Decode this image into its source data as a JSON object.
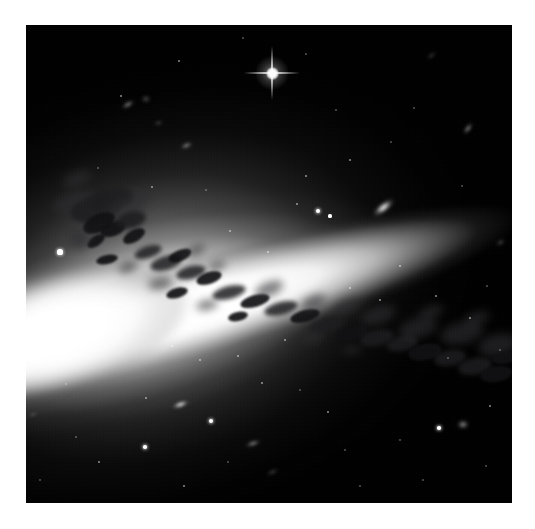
{
  "canvas": {
    "width": 535,
    "height": 529,
    "background_color": "#ffffff"
  },
  "image_panel": {
    "label": "edge-on-spiral-galaxy-astronomical-image",
    "x": 26,
    "y": 25,
    "width": 486,
    "height": 478,
    "background_color": "#000000",
    "border_color": "#000000"
  },
  "scene": {
    "subject": "edge-on spiral galaxy",
    "orientation_label": "disk inclined, descending left to right",
    "disk": {
      "rotation_deg": -16,
      "center_x_pct": 50,
      "center_y_pct": 50,
      "wrap_x": -130,
      "wrap_y": -48,
      "wrap_width": 746,
      "wrap_height": 574,
      "core_color": "#ffffff",
      "halo_color": "#9a9a9a"
    },
    "dust_lane": {
      "color": "#1c1c1e",
      "description": "dark dust lane clumps along the disk plane"
    }
  },
  "bright_star": {
    "label": "foreground star with diffraction spikes",
    "x": 272,
    "y": 73,
    "size": 56,
    "color": "#ffffff",
    "spikes": 4
  },
  "mini_galaxies": [
    {
      "name": "companion-galaxy-edge-on",
      "x": 383,
      "y": 207,
      "w": 27,
      "h": 11,
      "rot": -38,
      "style": ""
    },
    {
      "name": "background-galaxy-upper-left",
      "x": 128,
      "y": 104,
      "w": 16,
      "h": 7,
      "rot": -30,
      "style": "dim"
    },
    {
      "name": "background-galaxy-upper-left-2",
      "x": 146,
      "y": 99,
      "w": 12,
      "h": 10,
      "rot": 0,
      "style": "vdim"
    },
    {
      "name": "background-galaxy-upper-mid",
      "x": 186,
      "y": 145,
      "w": 15,
      "h": 7,
      "rot": -22,
      "style": "dim"
    },
    {
      "name": "background-galaxy-right-upper",
      "x": 468,
      "y": 128,
      "w": 16,
      "h": 7,
      "rot": -52,
      "style": "dim"
    },
    {
      "name": "background-galaxy-lower-left",
      "x": 180,
      "y": 404,
      "w": 19,
      "h": 7,
      "rot": -20,
      "style": ""
    },
    {
      "name": "background-galaxy-lower-mid",
      "x": 253,
      "y": 443,
      "w": 18,
      "h": 7,
      "rot": -18,
      "style": "dim"
    },
    {
      "name": "background-galaxy-right-edge",
      "x": 500,
      "y": 242,
      "w": 13,
      "h": 7,
      "rot": -34,
      "style": "vdim"
    },
    {
      "name": "background-galaxy-top-right",
      "x": 431,
      "y": 55,
      "w": 13,
      "h": 5,
      "rot": -40,
      "style": "vdim"
    },
    {
      "name": "background-galaxy-lower-right",
      "x": 463,
      "y": 424,
      "w": 14,
      "h": 11,
      "rot": 0,
      "style": "dim"
    },
    {
      "name": "background-galaxy-far-left",
      "x": 33,
      "y": 414,
      "w": 14,
      "h": 5,
      "rot": -16,
      "style": "vdim"
    },
    {
      "name": "background-galaxy-bottom",
      "x": 272,
      "y": 472,
      "w": 15,
      "h": 6,
      "rot": -24,
      "style": "vdim"
    },
    {
      "name": "background-galaxy-mid-left",
      "x": 158,
      "y": 123,
      "w": 11,
      "h": 6,
      "rot": -12,
      "style": "vdim"
    }
  ],
  "stars": [
    {
      "x": 60,
      "y": 252,
      "r": 2.6,
      "c": "bright"
    },
    {
      "x": 318,
      "y": 211,
      "r": 2.4,
      "c": "bright"
    },
    {
      "x": 330,
      "y": 216,
      "r": 1.6,
      "c": ""
    },
    {
      "x": 179,
      "y": 61,
      "r": 1.2,
      "c": "f"
    },
    {
      "x": 243,
      "y": 38,
      "r": 1.0,
      "c": "ff"
    },
    {
      "x": 121,
      "y": 96,
      "r": 1.3,
      "c": "f"
    },
    {
      "x": 297,
      "y": 204,
      "r": 1.1,
      "c": "f"
    },
    {
      "x": 306,
      "y": 176,
      "r": 1.1,
      "c": "f"
    },
    {
      "x": 350,
      "y": 160,
      "r": 1.2,
      "c": "f"
    },
    {
      "x": 391,
      "y": 142,
      "r": 1.0,
      "c": "ff"
    },
    {
      "x": 414,
      "y": 108,
      "r": 1.0,
      "c": "ff"
    },
    {
      "x": 98,
      "y": 168,
      "r": 1.0,
      "c": "ff"
    },
    {
      "x": 152,
      "y": 187,
      "r": 1.3,
      "c": "f"
    },
    {
      "x": 206,
      "y": 190,
      "r": 1.0,
      "c": "ff"
    },
    {
      "x": 230,
      "y": 231,
      "r": 1.2,
      "c": "f"
    },
    {
      "x": 268,
      "y": 252,
      "r": 1.2,
      "c": "f"
    },
    {
      "x": 350,
      "y": 288,
      "r": 1.4,
      "c": "f"
    },
    {
      "x": 380,
      "y": 300,
      "r": 1.2,
      "c": "f"
    },
    {
      "x": 400,
      "y": 266,
      "r": 1.3,
      "c": "f"
    },
    {
      "x": 436,
      "y": 296,
      "r": 1.2,
      "c": "f"
    },
    {
      "x": 470,
      "y": 318,
      "r": 1.3,
      "c": "f"
    },
    {
      "x": 487,
      "y": 286,
      "r": 1.1,
      "c": "ff"
    },
    {
      "x": 96,
      "y": 295,
      "r": 1.2,
      "c": "f"
    },
    {
      "x": 118,
      "y": 330,
      "r": 1.2,
      "c": "f"
    },
    {
      "x": 140,
      "y": 310,
      "r": 1.1,
      "c": "ff"
    },
    {
      "x": 172,
      "y": 346,
      "r": 1.4,
      "c": "f"
    },
    {
      "x": 200,
      "y": 360,
      "r": 1.2,
      "c": "f"
    },
    {
      "x": 238,
      "y": 356,
      "r": 1.3,
      "c": "f"
    },
    {
      "x": 262,
      "y": 383,
      "r": 1.2,
      "c": "f"
    },
    {
      "x": 211,
      "y": 421,
      "r": 2.0,
      "c": "bright"
    },
    {
      "x": 146,
      "y": 398,
      "r": 1.4,
      "c": "f"
    },
    {
      "x": 300,
      "y": 390,
      "r": 1.1,
      "c": "ff"
    },
    {
      "x": 328,
      "y": 412,
      "r": 1.2,
      "c": "f"
    },
    {
      "x": 145,
      "y": 447,
      "r": 1.8,
      "c": "bright"
    },
    {
      "x": 99,
      "y": 462,
      "r": 1.2,
      "c": "f"
    },
    {
      "x": 76,
      "y": 437,
      "r": 1.1,
      "c": "ff"
    },
    {
      "x": 184,
      "y": 486,
      "r": 1.2,
      "c": "f"
    },
    {
      "x": 228,
      "y": 462,
      "r": 1.0,
      "c": "ff"
    },
    {
      "x": 345,
      "y": 450,
      "r": 1.1,
      "c": "ff"
    },
    {
      "x": 400,
      "y": 440,
      "r": 1.0,
      "c": "ff"
    },
    {
      "x": 439,
      "y": 428,
      "r": 1.8,
      "c": "bright"
    },
    {
      "x": 490,
      "y": 406,
      "r": 1.2,
      "c": "f"
    },
    {
      "x": 360,
      "y": 486,
      "r": 1.0,
      "c": "ff"
    },
    {
      "x": 486,
      "y": 466,
      "r": 1.1,
      "c": "ff"
    },
    {
      "x": 58,
      "y": 330,
      "r": 1.0,
      "c": "ff"
    },
    {
      "x": 423,
      "y": 480,
      "r": 1.0,
      "c": "ff"
    },
    {
      "x": 258,
      "y": 310,
      "r": 1.0,
      "c": "ff"
    },
    {
      "x": 285,
      "y": 340,
      "r": 1.1,
      "c": "f"
    },
    {
      "x": 448,
      "y": 358,
      "r": 1.0,
      "c": "ff"
    },
    {
      "x": 500,
      "y": 350,
      "r": 1.0,
      "c": "ff"
    },
    {
      "x": 66,
      "y": 384,
      "r": 1.0,
      "c": "ff"
    },
    {
      "x": 40,
      "y": 480,
      "r": 1.0,
      "c": "ff"
    },
    {
      "x": 306,
      "y": 54,
      "r": 0.9,
      "c": "ff"
    },
    {
      "x": 462,
      "y": 186,
      "r": 1.0,
      "c": "ff"
    },
    {
      "x": 336,
      "y": 110,
      "r": 0.9,
      "c": "ff"
    }
  ],
  "dust_clumps": [
    {
      "x": 52,
      "y": 192,
      "w": 44,
      "h": 20,
      "rot": -18,
      "style": "soft"
    },
    {
      "x": 70,
      "y": 196,
      "w": 52,
      "h": 26,
      "rot": -12,
      "style": ""
    },
    {
      "x": 88,
      "y": 188,
      "w": 46,
      "h": 22,
      "rot": -8,
      "style": ""
    },
    {
      "x": 104,
      "y": 200,
      "w": 40,
      "h": 26,
      "rot": -20,
      "style": "soft"
    },
    {
      "x": 82,
      "y": 214,
      "w": 34,
      "h": 18,
      "rot": -26,
      "style": "hard"
    },
    {
      "x": 100,
      "y": 222,
      "w": 26,
      "h": 14,
      "rot": -20,
      "style": "hard"
    },
    {
      "x": 116,
      "y": 212,
      "w": 30,
      "h": 16,
      "rot": -14,
      "style": ""
    },
    {
      "x": 122,
      "y": 230,
      "w": 24,
      "h": 12,
      "rot": -30,
      "style": "hard"
    },
    {
      "x": 86,
      "y": 236,
      "w": 20,
      "h": 10,
      "rot": -34,
      "style": "hard"
    },
    {
      "x": 70,
      "y": 228,
      "w": 18,
      "h": 22,
      "rot": -40,
      "style": "soft"
    },
    {
      "x": 96,
      "y": 255,
      "w": 22,
      "h": 9,
      "rot": -12,
      "style": "hard"
    },
    {
      "x": 134,
      "y": 246,
      "w": 28,
      "h": 12,
      "rot": -18,
      "style": ""
    },
    {
      "x": 150,
      "y": 256,
      "w": 32,
      "h": 14,
      "rot": -16,
      "style": ""
    },
    {
      "x": 168,
      "y": 250,
      "w": 24,
      "h": 11,
      "rot": -22,
      "style": "hard"
    },
    {
      "x": 176,
      "y": 266,
      "w": 30,
      "h": 13,
      "rot": -14,
      "style": ""
    },
    {
      "x": 196,
      "y": 272,
      "w": 26,
      "h": 12,
      "rot": -18,
      "style": "hard"
    },
    {
      "x": 148,
      "y": 278,
      "w": 24,
      "h": 11,
      "rot": -10,
      "style": "soft"
    },
    {
      "x": 166,
      "y": 288,
      "w": 22,
      "h": 10,
      "rot": -16,
      "style": "hard"
    },
    {
      "x": 212,
      "y": 286,
      "w": 34,
      "h": 13,
      "rot": -14,
      "style": ""
    },
    {
      "x": 240,
      "y": 295,
      "w": 30,
      "h": 12,
      "rot": -16,
      "style": "hard"
    },
    {
      "x": 264,
      "y": 302,
      "w": 34,
      "h": 13,
      "rot": -14,
      "style": ""
    },
    {
      "x": 290,
      "y": 310,
      "w": 30,
      "h": 12,
      "rot": -15,
      "style": "hard"
    },
    {
      "x": 196,
      "y": 300,
      "w": 22,
      "h": 10,
      "rot": -12,
      "style": "soft"
    },
    {
      "x": 228,
      "y": 312,
      "w": 20,
      "h": 9,
      "rot": -12,
      "style": "hard"
    },
    {
      "x": 310,
      "y": 318,
      "w": 34,
      "h": 14,
      "rot": -14,
      "style": ""
    },
    {
      "x": 336,
      "y": 326,
      "w": 32,
      "h": 14,
      "rot": -13,
      "style": "hard"
    },
    {
      "x": 360,
      "y": 330,
      "w": 34,
      "h": 16,
      "rot": -12,
      "style": ""
    },
    {
      "x": 300,
      "y": 296,
      "w": 26,
      "h": 12,
      "rot": -24,
      "style": "soft"
    },
    {
      "x": 332,
      "y": 300,
      "w": 30,
      "h": 14,
      "rot": -18,
      "style": "soft"
    },
    {
      "x": 386,
      "y": 336,
      "w": 32,
      "h": 15,
      "rot": -12,
      "style": ""
    },
    {
      "x": 408,
      "y": 344,
      "w": 34,
      "h": 16,
      "rot": -11,
      "style": "hard"
    },
    {
      "x": 434,
      "y": 350,
      "w": 32,
      "h": 16,
      "rot": -10,
      "style": ""
    },
    {
      "x": 458,
      "y": 358,
      "w": 34,
      "h": 17,
      "rot": -10,
      "style": ""
    },
    {
      "x": 480,
      "y": 366,
      "w": 32,
      "h": 16,
      "rot": -9,
      "style": "hard"
    },
    {
      "x": 398,
      "y": 318,
      "w": 40,
      "h": 20,
      "rot": -16,
      "style": "soft"
    },
    {
      "x": 440,
      "y": 322,
      "w": 44,
      "h": 22,
      "rot": -14,
      "style": "soft"
    },
    {
      "x": 478,
      "y": 334,
      "w": 40,
      "h": 22,
      "rot": -12,
      "style": "soft"
    },
    {
      "x": 360,
      "y": 306,
      "w": 36,
      "h": 18,
      "rot": -18,
      "style": "soft"
    },
    {
      "x": 254,
      "y": 282,
      "w": 30,
      "h": 14,
      "rot": -22,
      "style": "soft"
    },
    {
      "x": 118,
      "y": 262,
      "w": 20,
      "h": 10,
      "rot": -24,
      "style": "soft"
    },
    {
      "x": 186,
      "y": 246,
      "w": 20,
      "h": 9,
      "rot": -26,
      "style": "soft"
    },
    {
      "x": 208,
      "y": 262,
      "w": 18,
      "h": 8,
      "rot": -20,
      "style": "soft"
    },
    {
      "x": 62,
      "y": 172,
      "w": 30,
      "h": 14,
      "rot": -22,
      "style": "soft"
    },
    {
      "x": 130,
      "y": 190,
      "w": 24,
      "h": 14,
      "rot": -16,
      "style": "soft"
    },
    {
      "x": 492,
      "y": 352,
      "w": 24,
      "h": 12,
      "rot": -8,
      "style": "hard"
    },
    {
      "x": 302,
      "y": 334,
      "w": 22,
      "h": 9,
      "rot": -10,
      "style": "soft"
    },
    {
      "x": 342,
      "y": 346,
      "w": 20,
      "h": 8,
      "rot": -10,
      "style": "soft"
    },
    {
      "x": 418,
      "y": 306,
      "w": 26,
      "h": 12,
      "rot": -20,
      "style": "soft"
    },
    {
      "x": 464,
      "y": 312,
      "w": 26,
      "h": 12,
      "rot": -16,
      "style": "soft"
    }
  ]
}
